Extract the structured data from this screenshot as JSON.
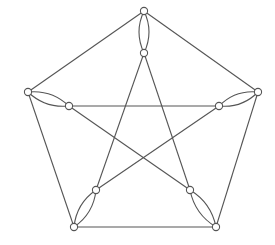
{
  "diagram": {
    "type": "graph",
    "colors": {
      "edge": "#555555",
      "node_fill": "#ffffff",
      "node_stroke": "#555555",
      "background": "#ffffff"
    },
    "node_radius": 3.6,
    "nodes": [
      {
        "id": "T",
        "x": 144,
        "y": 11
      },
      {
        "id": "R",
        "x": 258,
        "y": 92
      },
      {
        "id": "BR",
        "x": 216,
        "y": 227
      },
      {
        "id": "BL",
        "x": 74,
        "y": 227
      },
      {
        "id": "L",
        "x": 28,
        "y": 92
      },
      {
        "id": "Ti",
        "x": 144,
        "y": 53
      },
      {
        "id": "Ri",
        "x": 219,
        "y": 106
      },
      {
        "id": "BRi",
        "x": 190,
        "y": 190
      },
      {
        "id": "BLi",
        "x": 96,
        "y": 190
      },
      {
        "id": "Li",
        "x": 69,
        "y": 106
      }
    ],
    "outer_edges": [
      [
        "T",
        "R"
      ],
      [
        "R",
        "BR"
      ],
      [
        "BR",
        "BL"
      ],
      [
        "BL",
        "L"
      ],
      [
        "L",
        "T"
      ]
    ],
    "inner_edges": [
      [
        "Li",
        "Ri"
      ],
      [
        "Ti",
        "BLi"
      ],
      [
        "Ti",
        "BRi"
      ],
      [
        "Li",
        "BRi"
      ],
      [
        "Ri",
        "BLi"
      ]
    ],
    "double_spokes": [
      [
        "T",
        "Ti"
      ],
      [
        "R",
        "Ri"
      ],
      [
        "BR",
        "BRi"
      ],
      [
        "BL",
        "BLi"
      ],
      [
        "L",
        "Li"
      ]
    ],
    "spoke_bulge": 5
  }
}
